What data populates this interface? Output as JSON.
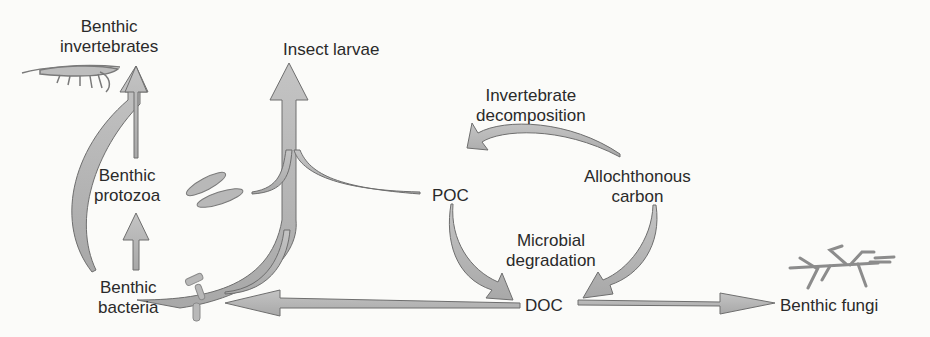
{
  "diagram": {
    "title": "",
    "nodes": {
      "benthic_invertebrates": {
        "line1": "Benthic",
        "line2": "invertebrates"
      },
      "insect_larvae": {
        "label": "Insect larvae"
      },
      "benthic_protozoa": {
        "line1": "Benthic",
        "line2": "protozoa"
      },
      "benthic_bacteria": {
        "line1": "Benthic",
        "line2": "bacteria"
      },
      "poc": {
        "label": "POC"
      },
      "allochthonous_carbon": {
        "line1": "Allochthonous",
        "line2": "carbon"
      },
      "doc": {
        "label": "DOC"
      },
      "benthic_fungi": {
        "label": "Benthic fungi"
      }
    },
    "process_labels": {
      "invertebrate_decomposition": {
        "line1": "Invertebrate",
        "line2": "decomposition"
      },
      "microbial_degradation": {
        "line1": "Microbial",
        "line2": "degradation"
      }
    },
    "edges": [
      {
        "from": "Benthic bacteria",
        "to": "Benthic invertebrates"
      },
      {
        "from": "Benthic protozoa",
        "to": "Benthic invertebrates"
      },
      {
        "from": "Benthic bacteria",
        "to": "Benthic protozoa"
      },
      {
        "from": "Benthic protozoa",
        "to": "Insect larvae"
      },
      {
        "from": "POC",
        "to": "Insect larvae"
      },
      {
        "from": "Benthic bacteria",
        "to": "Insect larvae"
      },
      {
        "from": "Allochthonous carbon",
        "to": "POC",
        "label": "Invertebrate decomposition"
      },
      {
        "from": "POC",
        "to": "DOC",
        "label": "Microbial degradation"
      },
      {
        "from": "Allochthonous carbon",
        "to": "DOC",
        "label": "Microbial degradation"
      },
      {
        "from": "DOC",
        "to": "Benthic bacteria"
      },
      {
        "from": "DOC",
        "to": "Benthic fungi"
      }
    ],
    "icons": [
      "shrimp-icon",
      "protozoa-icon",
      "bacteria-icon",
      "fungi-icon"
    ],
    "colors": {
      "arrow_fill": "#b3b3b3",
      "arrow_stroke": "#6e6e6e",
      "text": "#2a2a2a",
      "background": "#fbfbf9"
    }
  }
}
